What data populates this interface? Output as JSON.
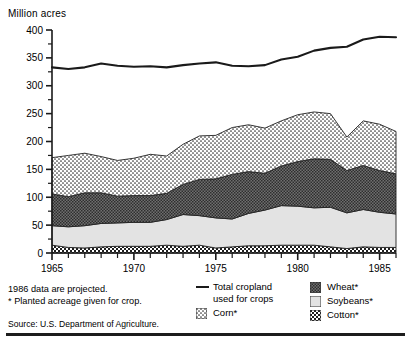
{
  "axis": {
    "y_title": "Million acres",
    "y_ticks": [
      0,
      50,
      100,
      150,
      200,
      250,
      300,
      350,
      400
    ],
    "x_ticks": [
      1965,
      1970,
      1975,
      1980,
      1985
    ]
  },
  "notes": {
    "projected": "1986 data are projected.",
    "planted": "* Planted acreage given for crop.",
    "source": "Source:  U.S. Department of Agriculture."
  },
  "legend": {
    "total": "Total cropland\nused for crops",
    "corn": "Corn*",
    "wheat": "Wheat*",
    "soybeans": "Soybeans*",
    "cotton": "Cotton*"
  },
  "chart_data": {
    "type": "area",
    "title": "",
    "subtitle": "",
    "xlabel": "",
    "ylabel": "Million acres",
    "xlim": [
      1965,
      1986
    ],
    "ylim": [
      0,
      400
    ],
    "grid": false,
    "legend_position": "bottom",
    "stacked": true,
    "x": [
      1965,
      1966,
      1967,
      1968,
      1969,
      1970,
      1971,
      1972,
      1973,
      1974,
      1975,
      1976,
      1977,
      1978,
      1979,
      1980,
      1981,
      1982,
      1983,
      1984,
      1985,
      1986
    ],
    "series": [
      {
        "name": "Cotton*",
        "stacked_order": 1,
        "values": [
          14,
          10,
          9,
          11,
          12,
          12,
          12,
          14,
          12,
          14,
          9,
          11,
          13,
          13,
          14,
          14,
          14,
          11,
          8,
          11,
          10,
          10
        ]
      },
      {
        "name": "Soybeans*",
        "stacked_order": 2,
        "values": [
          35,
          37,
          40,
          42,
          42,
          43,
          43,
          46,
          57,
          53,
          54,
          50,
          58,
          64,
          71,
          70,
          67,
          71,
          64,
          67,
          63,
          60
        ]
      },
      {
        "name": "Wheat*",
        "stacked_order": 3,
        "values": [
          57,
          54,
          59,
          55,
          48,
          48,
          48,
          47,
          54,
          65,
          70,
          80,
          75,
          66,
          71,
          80,
          88,
          86,
          76,
          79,
          75,
          72
        ]
      },
      {
        "name": "Corn*",
        "stacked_order": 4,
        "values": [
          65,
          74,
          71,
          65,
          64,
          67,
          74,
          67,
          72,
          78,
          78,
          84,
          84,
          81,
          81,
          84,
          84,
          82,
          60,
          80,
          83,
          76
        ]
      }
    ],
    "line_series": [
      {
        "name": "Total cropland used for crops",
        "values": [
          333,
          330,
          333,
          340,
          336,
          334,
          335,
          333,
          337,
          340,
          342,
          336,
          335,
          337,
          347,
          352,
          363,
          368,
          370,
          383,
          388,
          387,
          355,
          372,
          370,
          363
        ]
      }
    ],
    "line_series_x": [
      1965,
      1966,
      1967,
      1968,
      1969,
      1970,
      1971,
      1972,
      1973,
      1974,
      1975,
      1976,
      1977,
      1978,
      1979,
      1980,
      1981,
      1982,
      1983,
      1984,
      1985,
      1986
    ],
    "annotation": "1986 data are projected."
  }
}
